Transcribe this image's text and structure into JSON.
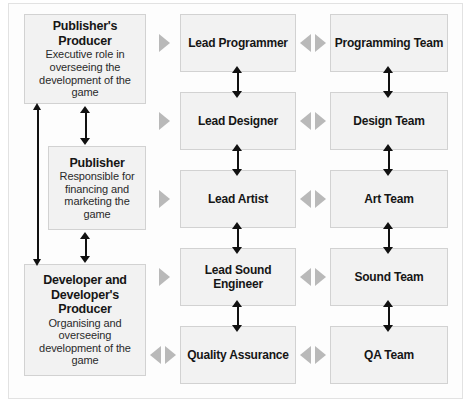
{
  "diagram": {
    "colors": {
      "box_fill": "#f2f2f2",
      "box_border": "#d2d2d2",
      "arrow_black": "#111111",
      "arrow_grey": "#b9b9b9",
      "frame": "#e2e2e2",
      "background": "#ffffff"
    },
    "columns": {
      "left": {
        "name": "business-roles-column",
        "boxes": [
          {
            "id": "publishers-producer",
            "title": "Publisher's Producer",
            "desc": "Executive role in overseeing the development of the game"
          },
          {
            "id": "publisher",
            "title": "Publisher",
            "desc": "Responsible for financing and marketing the game"
          },
          {
            "id": "developer-and-developers-producer",
            "title": "Developer and Developer's Producer",
            "desc": "Organising and overseeing development of the game"
          }
        ]
      },
      "middle": {
        "name": "lead-roles-column",
        "boxes": [
          {
            "id": "lead-programmer",
            "title": "Lead Programmer"
          },
          {
            "id": "lead-designer",
            "title": "Lead Designer"
          },
          {
            "id": "lead-artist",
            "title": "Lead Artist"
          },
          {
            "id": "lead-sound-engineer",
            "title": "Lead Sound Engineer"
          },
          {
            "id": "quality-assurance",
            "title": "Quality Assurance"
          }
        ]
      },
      "right": {
        "name": "teams-column",
        "boxes": [
          {
            "id": "programming-team",
            "title": "Programming Team"
          },
          {
            "id": "design-team",
            "title": "Design Team"
          },
          {
            "id": "art-team",
            "title": "Art Team"
          },
          {
            "id": "sound-team",
            "title": "Sound Team"
          },
          {
            "id": "qa-team",
            "title": "QA Team"
          }
        ]
      }
    },
    "connectors": {
      "left_to_middle": [
        {
          "row": 1,
          "kind": "one-way-right"
        },
        {
          "row": 2,
          "kind": "one-way-right"
        },
        {
          "row": 3,
          "kind": "one-way-right"
        },
        {
          "row": 4,
          "kind": "one-way-right"
        },
        {
          "row": 5,
          "kind": "two-way"
        }
      ],
      "middle_to_right": [
        {
          "row": 1,
          "kind": "two-way"
        },
        {
          "row": 2,
          "kind": "two-way"
        },
        {
          "row": 3,
          "kind": "two-way"
        },
        {
          "row": 4,
          "kind": "two-way"
        },
        {
          "row": 5,
          "kind": "two-way"
        }
      ],
      "vertical_black_two_way": [
        "publishers-producer <-> publisher",
        "publisher <-> developer-and-developers-producer",
        "publishers-producer <-> developer-and-developers-producer (outer left)",
        "lead-programmer <-> lead-designer",
        "lead-designer <-> lead-artist",
        "lead-artist <-> lead-sound-engineer",
        "lead-sound-engineer <-> quality-assurance",
        "programming-team <-> design-team",
        "design-team <-> art-team",
        "art-team <-> sound-team",
        "sound-team <-> qa-team"
      ]
    }
  }
}
